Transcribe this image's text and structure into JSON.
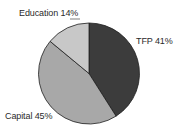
{
  "chart_data": {
    "type": "pie",
    "title": "",
    "categories": [
      "TFP",
      "Capital",
      "Education"
    ],
    "values": [
      41,
      45,
      14
    ],
    "unit": "%",
    "labels": [
      "TFP 41%",
      "Capital 45%",
      "Education 14%"
    ],
    "colors": [
      "#3c3c3c",
      "#a8a8a8",
      "#c8c8c8"
    ],
    "start_angle_deg": 0,
    "direction": "clockwise",
    "legend": "none (direct labels)",
    "grid": false
  },
  "labels": {
    "education": "Education 14%",
    "tfp": "TFP 41%",
    "capital": "Capital 45%"
  },
  "style": {
    "edge_color": "#1e1e1e",
    "background": "#ffffff"
  }
}
